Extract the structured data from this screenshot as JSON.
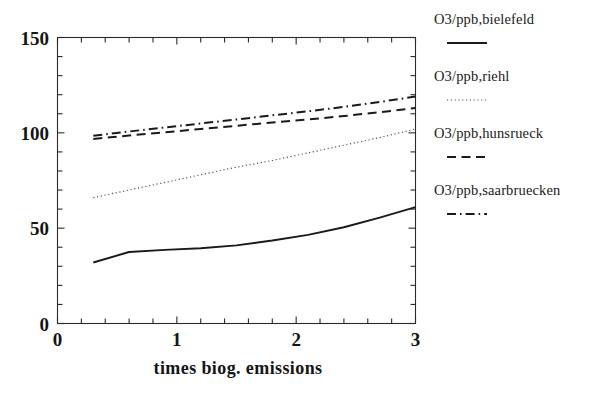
{
  "chart_data": {
    "type": "line",
    "title": "",
    "xlabel": "times biog. emissions",
    "ylabel": "",
    "xlim": [
      0,
      3
    ],
    "ylim": [
      0,
      150
    ],
    "grid": false,
    "legend_position": "right",
    "xticks": [
      "0",
      "1",
      "2",
      "3"
    ],
    "xtick_values": [
      0,
      1,
      2,
      3
    ],
    "xminor_step": 0.2,
    "yticks": [
      "0",
      "50",
      "100",
      "150"
    ],
    "ytick_values": [
      0,
      50,
      100,
      150
    ],
    "yminor_step": 10,
    "x": [
      0.3,
      0.6,
      0.9,
      1.2,
      1.5,
      1.8,
      2.1,
      2.4,
      2.7,
      3.0
    ],
    "series": [
      {
        "name": "O3/ppb,bielefeld",
        "style": "solid",
        "color": "#1a1a1a",
        "values": [
          32.0,
          37.5,
          38.6,
          39.5,
          41.0,
          43.5,
          46.5,
          50.5,
          55.5,
          61.0
        ]
      },
      {
        "name": "O3/ppb,riehl",
        "style": "dotted",
        "color": "#555555",
        "values": [
          66.0,
          70.0,
          74.0,
          78.0,
          82.0,
          85.5,
          89.5,
          93.5,
          97.5,
          102.0
        ]
      },
      {
        "name": "O3/ppb,hunsrueck",
        "style": "dashed",
        "color": "#1a1a1a",
        "values": [
          96.8,
          98.6,
          100.3,
          102.0,
          103.7,
          105.4,
          107.0,
          108.8,
          110.8,
          113.0
        ]
      },
      {
        "name": "O3/ppb,saarbruecken",
        "style": "dashdot",
        "color": "#1a1a1a",
        "values": [
          98.5,
          100.7,
          102.8,
          104.9,
          107.0,
          109.2,
          111.3,
          113.6,
          116.2,
          119.0
        ]
      }
    ]
  },
  "legend": {
    "entries": [
      {
        "label": "O3/ppb,bielefeld",
        "style": "solid"
      },
      {
        "label": "O3/ppb,riehl",
        "style": "dotted"
      },
      {
        "label": "O3/ppb,hunsrueck",
        "style": "dashed"
      },
      {
        "label": "O3/ppb,saarbruecken",
        "style": "dashdot"
      }
    ]
  },
  "axes": {
    "x_title": "times biog. emissions",
    "x_tick_labels": [
      "0",
      "1",
      "2",
      "3"
    ],
    "y_tick_labels": [
      "0",
      "50",
      "100",
      "150"
    ]
  }
}
